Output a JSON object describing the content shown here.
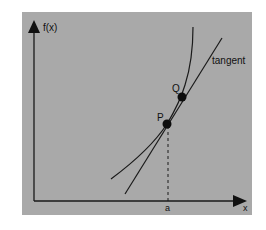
{
  "diagram": {
    "type": "tangent-to-curve",
    "background_color": "#a9a9a9",
    "line_color": "#1a1a1a",
    "axes": {
      "y_label": "f(x)",
      "x_label": "x"
    },
    "points": [
      {
        "label": "P",
        "description": "point of tangency"
      },
      {
        "label": "Q",
        "description": "second point on curve"
      }
    ],
    "tangent_label": "tangent",
    "x_marker_label": "a"
  }
}
